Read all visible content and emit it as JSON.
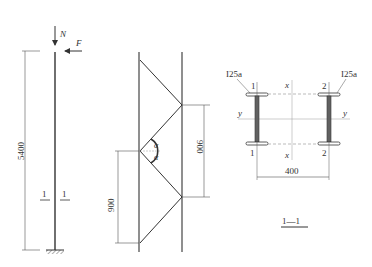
{
  "column": {
    "load_axial": "N",
    "load_lateral": "F",
    "height_dim": "5400",
    "section_mark_left": "1",
    "section_mark_right": "1"
  },
  "lacing": {
    "angle_top": "α",
    "angle_bottom": "α",
    "spacing_right": "900",
    "spacing_left": "900"
  },
  "section": {
    "profile_left": "I25a",
    "profile_right": "I25a",
    "chord_1_top": "1",
    "chord_1_bottom": "1",
    "chord_2_top": "2",
    "chord_2_bottom": "2",
    "axis_x_top": "x",
    "axis_x_bottom": "x",
    "axis_y_left": "y",
    "axis_y_right": "y",
    "width_dim": "400",
    "title": "1—1"
  }
}
